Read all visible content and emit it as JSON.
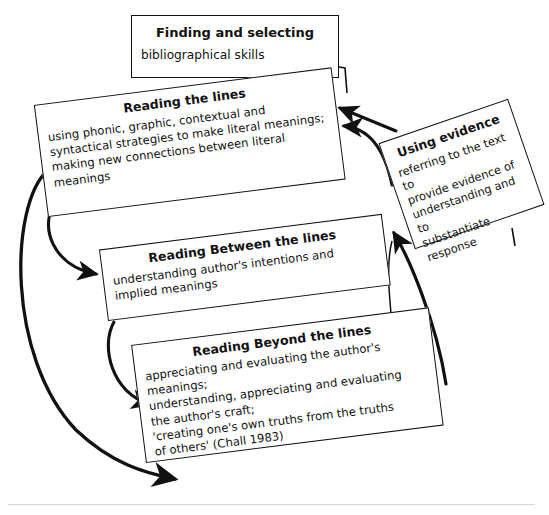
{
  "diagram": {
    "type": "flow-diagram",
    "background_color": "#ffffff",
    "stroke_color": "#111111",
    "nodes": [
      {
        "id": "finding",
        "title": "Finding and selecting",
        "body": "bibliographical skills"
      },
      {
        "id": "reading-the-lines",
        "title": "Reading the lines",
        "body": "using phonic, graphic, contextual and\nsyntactical strategies to make literal meanings;\nmaking new connections between literal\nmeanings"
      },
      {
        "id": "reading-between-the-lines",
        "title": "Reading Between the lines",
        "body": "understanding author's intentions and\nimplied meanings"
      },
      {
        "id": "reading-beyond-the-lines",
        "title": "Reading Beyond the lines",
        "body": "appreciating and evaluating the author's\nmeanings;\nunderstanding, appreciating and evaluating\nthe author's craft;\n'creating one's own truths from the truths\nof others' (Chall 1983)"
      },
      {
        "id": "using-evidence",
        "title": "Using evidence",
        "body": "referring to the text to\nprovide evidence of\nunderstanding and to\nsubstantiate response"
      }
    ],
    "connectors": [
      {
        "id": "lines-to-between",
        "from": "reading-the-lines",
        "to": "reading-between-the-lines",
        "style": "curved-arrow"
      },
      {
        "id": "lines-to-beyond",
        "from": "reading-the-lines",
        "to": "reading-beyond-the-lines",
        "style": "curved-arrow"
      },
      {
        "id": "between-to-beyond",
        "from": "reading-between-the-lines",
        "to": "reading-beyond-the-lines",
        "style": "curved-arrow"
      },
      {
        "id": "evidence-to-lines-a",
        "from": "using-evidence",
        "to": "reading-the-lines",
        "style": "arrow"
      },
      {
        "id": "evidence-to-lines-b",
        "from": "using-evidence",
        "to": "reading-the-lines",
        "style": "curved-arrow"
      },
      {
        "id": "beyond-to-evidence",
        "from": "reading-beyond-the-lines",
        "to": "using-evidence",
        "style": "curved-arrow"
      },
      {
        "id": "between-to-evidence",
        "from": "reading-between-the-lines",
        "to": "using-evidence",
        "style": "curved-arrow"
      }
    ]
  }
}
